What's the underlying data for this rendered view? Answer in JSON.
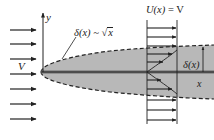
{
  "diagram": {
    "labels": {
      "freestream_velocity": "V",
      "y_axis": "y",
      "x_axis": "x",
      "thickness_formula_lhs": "δ(x) ~ ",
      "thickness_formula_sqrt": "x",
      "outer_velocity_lhs": "U(x)",
      "outer_velocity_rhs": " = V",
      "thickness_right": "δ(x)"
    },
    "freestream_arrows": {
      "count": 7,
      "y_positions": [
        30,
        44,
        59,
        74,
        89,
        104,
        119
      ],
      "x_start": 10,
      "x_end": 36
    },
    "plate": {
      "leading_edge": [
        41,
        72
      ],
      "y": 72,
      "x_end": 214
    },
    "boundary_layer": {
      "shape": "sqrt",
      "fill_color": "#b8b8b8",
      "edge_style": "dashed",
      "upper_edge_y_at_right": 46,
      "lower_edge_y_at_right": 96
    },
    "velocity_profile": {
      "x_wall": 147,
      "x_outer": 177,
      "top": 20,
      "bottom": 124,
      "arrow_y_positions": [
        28,
        37,
        46,
        54,
        62,
        80,
        90,
        100,
        110,
        120
      ]
    },
    "colors": {
      "line": "#222222",
      "shade": "#b8b8b8",
      "plate": "#555555",
      "background": "#ffffff"
    }
  }
}
